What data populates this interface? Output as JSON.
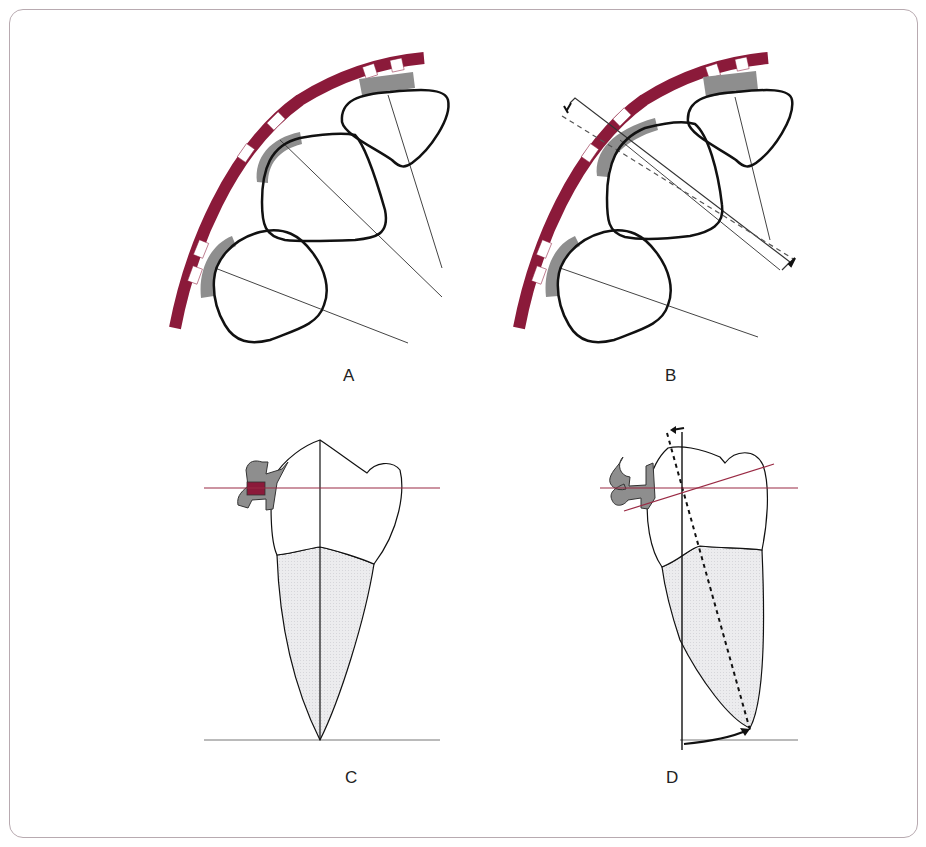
{
  "figure": {
    "panels": [
      {
        "id": "A",
        "label": "A",
        "description": "Dental arch with archwire and brackets on three teeth; long axes radiating"
      },
      {
        "id": "B",
        "label": "B",
        "description": "Same arch with bracket offset and rotation arrows; dashed reference line"
      },
      {
        "id": "C",
        "label": "C",
        "description": "Tooth in profile with bracket; horizontal archwire line through slot; vertical long axis"
      },
      {
        "id": "D",
        "label": "D",
        "description": "Tooth tipped with bracket; tilted line, dashed axis and rotation arrows"
      }
    ]
  },
  "colors": {
    "archwire": "#8b1a3a",
    "bracket": "#8e8e8e",
    "root_fill": "#e8e8ea",
    "outline": "#111111",
    "reference_line_red": "#9a2a44",
    "frame_border": "#b8aab0"
  }
}
